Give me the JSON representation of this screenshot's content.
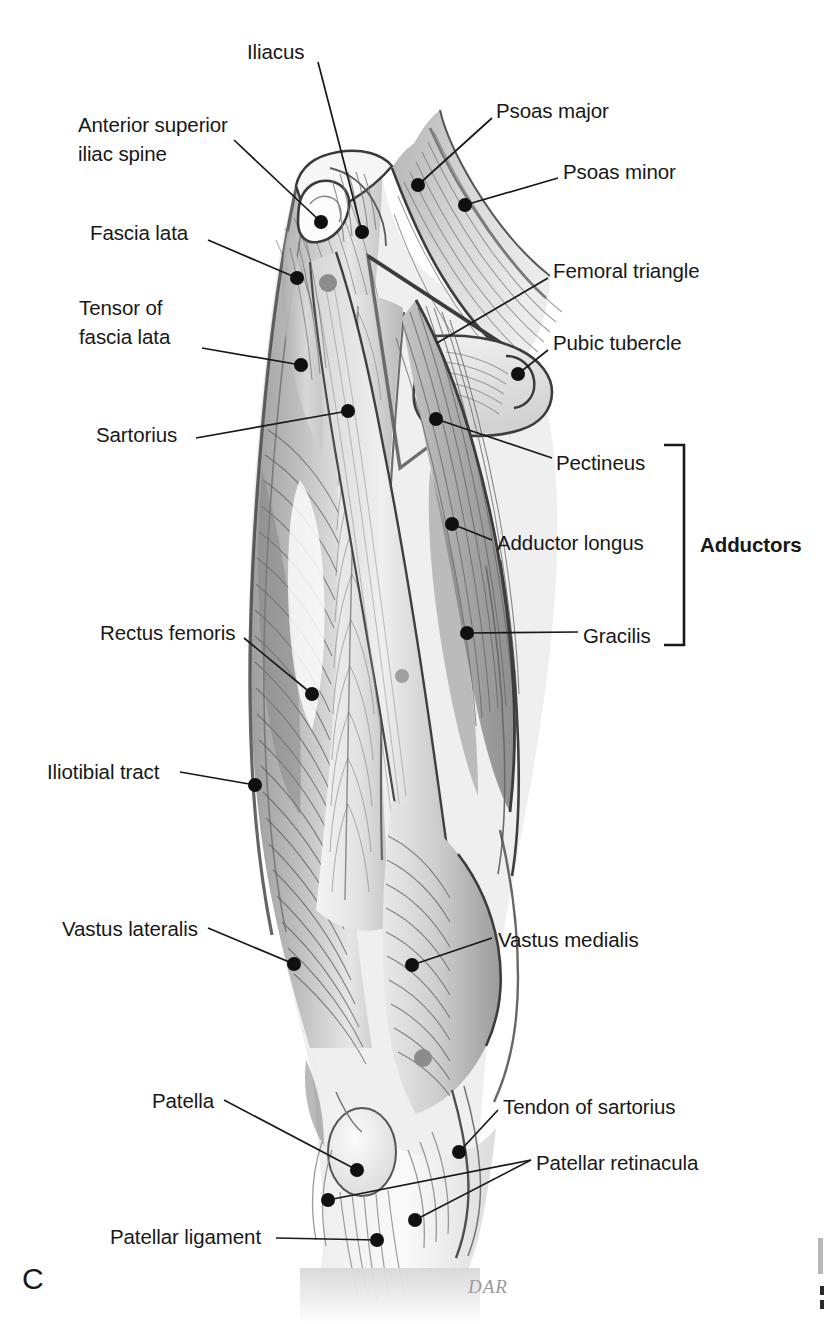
{
  "figure": {
    "panel_letter": "C",
    "artist_signature": "DAR",
    "ink_color": "#181818",
    "marker_color": "#101010",
    "highlight_marker_color": "#8c8c8c"
  },
  "group_bracket": {
    "label": "Adductors",
    "members": [
      "Pectineus",
      "Adductor longus",
      "Gracilis"
    ]
  },
  "labels": [
    {
      "id": "iliacus",
      "text": "Iliacus",
      "align": "left",
      "x": 247,
      "y": 37,
      "dot": [
        362,
        232
      ]
    },
    {
      "id": "anterior-superior-iliac-spine",
      "text": "Anterior superior\niliac spine",
      "align": "left",
      "x": 78,
      "y": 110,
      "dot": [
        321,
        222
      ]
    },
    {
      "id": "psoas-major",
      "text": "Psoas major",
      "align": "left",
      "x": 496,
      "y": 96,
      "dot": [
        418,
        185
      ]
    },
    {
      "id": "psoas-minor",
      "text": "Psoas minor",
      "align": "left",
      "x": 563,
      "y": 157,
      "dot": [
        465,
        205
      ]
    },
    {
      "id": "fascia-lata",
      "text": "Fascia lata",
      "align": "left",
      "x": 90,
      "y": 218,
      "dot": [
        297,
        278
      ]
    },
    {
      "id": "femoral-triangle",
      "text": "Femoral triangle",
      "align": "left",
      "x": 553,
      "y": 256,
      "dot": [
        437,
        343
      ]
    },
    {
      "id": "tensor-of-fascia-lata",
      "text": "Tensor of\nfascia lata",
      "align": "left",
      "x": 79,
      "y": 293,
      "dot": [
        301,
        365
      ]
    },
    {
      "id": "pubic-tubercle",
      "text": "Pubic tubercle",
      "align": "left",
      "x": 553,
      "y": 328,
      "dot": [
        518,
        374
      ]
    },
    {
      "id": "sartorius",
      "text": "Sartorius",
      "align": "left",
      "x": 96,
      "y": 420,
      "dot": [
        348,
        411
      ]
    },
    {
      "id": "pectineus",
      "text": "Pectineus",
      "align": "left",
      "x": 556,
      "y": 448,
      "dot": [
        436,
        419
      ]
    },
    {
      "id": "adductor-longus",
      "text": "Adductor longus",
      "align": "left",
      "x": 497,
      "y": 528,
      "dot": [
        452,
        524
      ]
    },
    {
      "id": "gracilis",
      "text": "Gracilis",
      "align": "left",
      "x": 583,
      "y": 621,
      "dot": [
        467,
        633
      ]
    },
    {
      "id": "rectus-femoris",
      "text": "Rectus femoris",
      "align": "left",
      "x": 100,
      "y": 618,
      "dot": [
        312,
        694
      ]
    },
    {
      "id": "iliotibial-tract",
      "text": "Iliotibial tract",
      "align": "left",
      "x": 47,
      "y": 757,
      "dot": [
        255,
        785
      ]
    },
    {
      "id": "vastus-lateralis",
      "text": "Vastus lateralis",
      "align": "left",
      "x": 62,
      "y": 914,
      "dot": [
        294,
        964
      ]
    },
    {
      "id": "vastus-medialis",
      "text": "Vastus medialis",
      "align": "left",
      "x": 498,
      "y": 925,
      "dot": [
        412,
        965
      ]
    },
    {
      "id": "patella",
      "text": "Patella",
      "align": "left",
      "x": 152,
      "y": 1086,
      "dot": [
        357,
        1170
      ]
    },
    {
      "id": "tendon-of-sartorius",
      "text": "Tendon of sartorius",
      "align": "left",
      "x": 503,
      "y": 1092,
      "dot": [
        459,
        1152
      ]
    },
    {
      "id": "patellar-retinacula",
      "text": "Patellar retinacula",
      "align": "left",
      "x": 536,
      "y": 1148,
      "dot": [
        328,
        1200
      ],
      "dot2": [
        415,
        1220
      ]
    },
    {
      "id": "patellar-ligament",
      "text": "Patellar ligament",
      "align": "left",
      "x": 110,
      "y": 1222,
      "dot": [
        377,
        1240
      ]
    }
  ]
}
